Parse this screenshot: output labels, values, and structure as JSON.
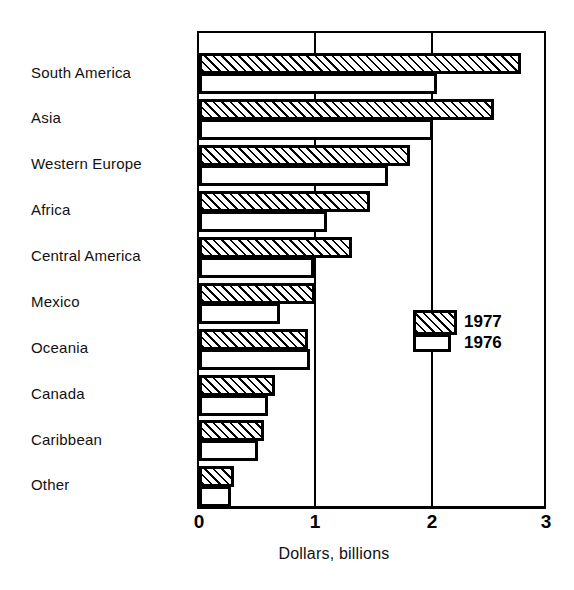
{
  "chart_data": {
    "type": "bar",
    "orientation": "horizontal",
    "title": "",
    "xlabel": "Dollars, billions",
    "ylabel": "",
    "xlim": [
      0,
      3
    ],
    "xticks": [
      "0",
      "1",
      "2",
      "3"
    ],
    "grid": true,
    "legend_position": "inside-right",
    "categories": [
      "South America",
      "Asia",
      "Western Europe",
      "Africa",
      "Central America",
      "Mexico",
      "Oceania",
      "Canada",
      "Caribbean",
      "Other"
    ],
    "series": [
      {
        "name": "1977",
        "style": "hatched",
        "values": [
          2.78,
          2.55,
          1.82,
          1.48,
          1.32,
          1.0,
          0.94,
          0.66,
          0.56,
          0.3
        ]
      },
      {
        "name": "1976",
        "style": "open",
        "values": [
          2.06,
          2.02,
          1.63,
          1.11,
          0.99,
          0.7,
          0.96,
          0.6,
          0.51,
          0.28
        ]
      }
    ]
  },
  "legend": {
    "entries": [
      {
        "label": "1977",
        "style": "hatched"
      },
      {
        "label": "1976",
        "style": "open"
      }
    ]
  },
  "axis": {
    "x_title": "Dollars, billions",
    "x_tick_labels": [
      "0",
      "1",
      "2",
      "3"
    ]
  },
  "colors": {
    "ink": "#000000",
    "background": "#ffffff"
  }
}
